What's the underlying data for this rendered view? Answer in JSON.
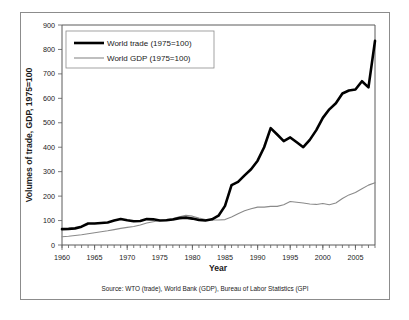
{
  "chart_data": {
    "type": "line",
    "title": "",
    "xlabel": "Year",
    "ylabel": "Volumes of trade, GDP, 1975=100",
    "xlim": [
      1960,
      2008
    ],
    "ylim": [
      0,
      900
    ],
    "ytick_step": 100,
    "xtick_step": 5,
    "grid": false,
    "legend_position": "upper left",
    "source_note": "Source: WTO (trade), World Bank (GDP), Bureau of Labor Statistics (GPI",
    "yticks": [
      "0",
      "100",
      "200",
      "300",
      "400",
      "500",
      "600",
      "700",
      "800",
      "900"
    ],
    "xticks": [
      "1960",
      "1965",
      "1970",
      "1975",
      "1980",
      "1985",
      "1990",
      "1995",
      "2000",
      "2005"
    ],
    "x": [
      1960,
      1961,
      1962,
      1963,
      1964,
      1965,
      1966,
      1967,
      1968,
      1969,
      1970,
      1971,
      1972,
      1973,
      1974,
      1975,
      1976,
      1977,
      1978,
      1979,
      1980,
      1981,
      1982,
      1983,
      1984,
      1985,
      1986,
      1987,
      1988,
      1989,
      1990,
      1991,
      1992,
      1993,
      1994,
      1995,
      1996,
      1997,
      1998,
      1999,
      2000,
      2001,
      2002,
      2003,
      2004,
      2005,
      2006,
      2007,
      2008
    ],
    "series": [
      {
        "name": "World trade (1975=100)",
        "color": "#000000",
        "width": "thick",
        "values": [
          65,
          66,
          68,
          75,
          88,
          88,
          90,
          92,
          100,
          106,
          101,
          97,
          98,
          106,
          105,
          100,
          101,
          104,
          110,
          112,
          108,
          102,
          100,
          105,
          120,
          160,
          245,
          258,
          285,
          310,
          345,
          400,
          478,
          452,
          425,
          440,
          420,
          400,
          430,
          470,
          520,
          555,
          580,
          620,
          632,
          636,
          670,
          645,
          835
        ]
      },
      {
        "name": "World GDP (1975=100)",
        "color": "#8a8a8a",
        "width": "thin",
        "values": [
          34,
          36,
          39,
          42,
          46,
          50,
          54,
          58,
          63,
          68,
          72,
          76,
          82,
          90,
          95,
          100,
          104,
          108,
          115,
          122,
          118,
          110,
          104,
          102,
          102,
          104,
          115,
          128,
          140,
          148,
          155,
          155,
          158,
          158,
          165,
          178,
          175,
          172,
          168,
          166,
          170,
          165,
          172,
          190,
          205,
          215,
          230,
          245,
          255
        ]
      }
    ]
  },
  "legend": {
    "items": [
      {
        "label": "World trade (1975=100)"
      },
      {
        "label": "World GDP (1975=100)"
      }
    ]
  }
}
